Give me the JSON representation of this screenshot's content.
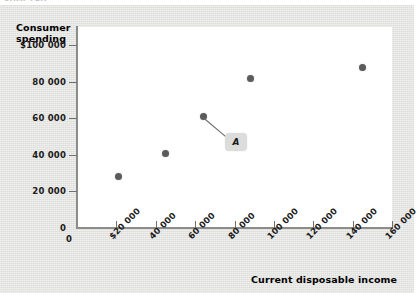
{
  "figure": {
    "ghost_text": "CHAPTER",
    "panel_color": "#e3e3e1",
    "plot_bg": "#ffffff",
    "point_color": "#5b5b5b",
    "annotation_box_color": "#dcdcda"
  },
  "chart_data": {
    "type": "scatter",
    "title": "",
    "xlabel": "Current disposable income",
    "ylabel": "Consumer spending",
    "xlim": [
      0,
      160000
    ],
    "ylim": [
      0,
      110000
    ],
    "grid": false,
    "legend": "none",
    "x_ticks": [
      {
        "value": 0,
        "label": "0"
      },
      {
        "value": 20000,
        "label": "$20 000"
      },
      {
        "value": 40000,
        "label": "40 000"
      },
      {
        "value": 60000,
        "label": "60 000"
      },
      {
        "value": 80000,
        "label": "80 000"
      },
      {
        "value": 100000,
        "label": "100 000"
      },
      {
        "value": 120000,
        "label": "120 000"
      },
      {
        "value": 140000,
        "label": "140 000"
      },
      {
        "value": 160000,
        "label": "160 000"
      }
    ],
    "y_ticks": [
      {
        "value": 20000,
        "label": "20 000"
      },
      {
        "value": 40000,
        "label": "40 000"
      },
      {
        "value": 60000,
        "label": "60 000"
      },
      {
        "value": 80000,
        "label": "80 000"
      },
      {
        "value": 100000,
        "label": "$100 000"
      }
    ],
    "y_zero_label": "0",
    "points": [
      {
        "x": 21000,
        "y": 28000,
        "label": ""
      },
      {
        "x": 45000,
        "y": 41000,
        "label": ""
      },
      {
        "x": 64000,
        "y": 61000,
        "label": ""
      },
      {
        "x": 88000,
        "y": 82000,
        "label": ""
      },
      {
        "x": 145000,
        "y": 88000,
        "label": ""
      }
    ],
    "annotations": [
      {
        "text": "A",
        "point_index": 2
      }
    ]
  }
}
